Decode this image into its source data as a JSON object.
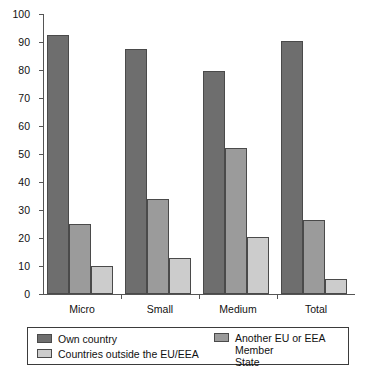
{
  "chart_data": {
    "type": "bar",
    "title": "",
    "subtitle": "",
    "xlabel": "",
    "ylabel": "",
    "categories": [
      "Micro",
      "Small",
      "Medium",
      "Total"
    ],
    "series": [
      {
        "name": "Own country",
        "color": "#6e6e6e",
        "values": [
          92.5,
          87.5,
          79.5,
          90.5
        ]
      },
      {
        "name": "Another EU or EEA Member State",
        "color": "#9b9b9b",
        "values": [
          25,
          34,
          52,
          26.5
        ]
      },
      {
        "name": "Countries outside the EU/EEA",
        "color": "#cccccc",
        "values": [
          10,
          13,
          20.5,
          5.5
        ]
      }
    ],
    "ylim": [
      0,
      100
    ],
    "yticks": [
      0,
      10,
      20,
      30,
      40,
      50,
      60,
      70,
      80,
      90,
      100
    ],
    "ytick_labels": [
      "0",
      "10",
      "20",
      "30",
      "40",
      "50",
      "60",
      "70",
      "80",
      "90",
      "100"
    ],
    "grid": false,
    "legend_position": "bottom",
    "legend_entries": [
      "Own country",
      "Another EU or EEA Member State",
      "Countries outside the EU/EEA"
    ]
  },
  "legend": {
    "items": [
      {
        "label": "Own country"
      },
      {
        "label": "Another EU or EEA Member\nState"
      },
      {
        "label": "Countries outside the EU/EEA"
      }
    ]
  }
}
